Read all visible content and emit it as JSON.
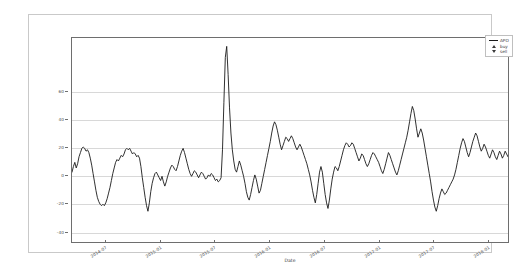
{
  "figure": {
    "background": "#ffffff",
    "border_color": "#c9c9c9",
    "axes_color": "#6e6e6e",
    "grid_color": "#d8d8d8",
    "line_color": "#1a1a1a"
  },
  "legend": {
    "position": "top-right",
    "entries": [
      {
        "label": "APO",
        "marker": "line",
        "icon": "line-marker-icon"
      },
      {
        "label": "buy",
        "marker": "triangle-up",
        "icon": "triangle-up-icon"
      },
      {
        "label": "sell",
        "marker": "triangle-down",
        "icon": "triangle-down-icon"
      }
    ]
  },
  "chart_data": {
    "type": "line",
    "title": "",
    "subtitle": "",
    "xlabel": "Date",
    "ylabel": "",
    "grid": true,
    "legend_position": "upper right",
    "ylim": [
      -48,
      98
    ],
    "yticks": [
      60,
      40,
      20,
      0,
      -20,
      -40
    ],
    "ytick_labels": [
      "60",
      "40",
      "20",
      "0",
      "-20",
      "-40"
    ],
    "xlim": [
      "2014-04",
      "2018-04"
    ],
    "xticks": [
      "2014-07",
      "2015-01",
      "2015-07",
      "2016-01",
      "2016-07",
      "2017-01",
      "2017-07",
      "2018-01"
    ],
    "xtick_labels": [
      "2014-07",
      "2015-01",
      "2015-07",
      "2016-01",
      "2016-07",
      "2017-01",
      "2017-07",
      "2018-01"
    ],
    "series": [
      {
        "name": "APO",
        "color": "#1a1a1a",
        "values": [
          2,
          6,
          9,
          5,
          8,
          13,
          16,
          19,
          20,
          19,
          17,
          18,
          16,
          12,
          7,
          1,
          -5,
          -11,
          -16,
          -19,
          -21,
          -22,
          -21,
          -22,
          -20,
          -17,
          -13,
          -9,
          -4,
          1,
          5,
          9,
          11,
          10,
          12,
          14,
          13,
          15,
          18,
          19,
          18,
          19,
          17,
          15,
          16,
          15,
          13,
          14,
          12,
          6,
          -2,
          -9,
          -16,
          -22,
          -26,
          -20,
          -12,
          -6,
          -2,
          1,
          2,
          0,
          -2,
          -4,
          -1,
          -5,
          -8,
          -5,
          -1,
          2,
          5,
          7,
          6,
          4,
          3,
          6,
          10,
          14,
          17,
          19,
          16,
          12,
          8,
          4,
          1,
          -1,
          1,
          3,
          2,
          0,
          -2,
          0,
          2,
          1,
          -1,
          -3,
          -2,
          0,
          -1,
          1,
          0,
          -2,
          -4,
          -3,
          -5,
          -4,
          -2,
          18,
          52,
          84,
          92,
          72,
          48,
          30,
          18,
          10,
          4,
          2,
          6,
          10,
          7,
          3,
          -1,
          -6,
          -12,
          -16,
          -18,
          -14,
          -9,
          -4,
          0,
          -3,
          -8,
          -13,
          -11,
          -6,
          -1,
          4,
          9,
          14,
          19,
          24,
          30,
          35,
          38,
          36,
          32,
          27,
          22,
          18,
          21,
          24,
          27,
          26,
          24,
          26,
          28,
          26,
          23,
          20,
          18,
          20,
          22,
          20,
          17,
          14,
          11,
          8,
          4,
          0,
          -5,
          -11,
          -16,
          -20,
          -14,
          -6,
          2,
          6,
          2,
          -6,
          -14,
          -20,
          -24,
          -18,
          -10,
          -3,
          2,
          6,
          5,
          3,
          6,
          10,
          14,
          18,
          21,
          23,
          22,
          20,
          21,
          23,
          22,
          19,
          16,
          13,
          10,
          12,
          15,
          14,
          11,
          8,
          6,
          8,
          11,
          14,
          16,
          15,
          13,
          11,
          9,
          6,
          3,
          1,
          4,
          8,
          12,
          16,
          14,
          11,
          8,
          5,
          2,
          0,
          3,
          7,
          11,
          15,
          19,
          23,
          27,
          32,
          38,
          44,
          49,
          46,
          40,
          33,
          27,
          30,
          33,
          30,
          25,
          19,
          13,
          7,
          1,
          -5,
          -12,
          -18,
          -23,
          -26,
          -22,
          -17,
          -13,
          -10,
          -12,
          -14,
          -13,
          -11,
          -9,
          -7,
          -5,
          -3,
          0,
          4,
          9,
          14,
          19,
          23,
          26,
          24,
          20,
          16,
          13,
          16,
          20,
          24,
          27,
          30,
          28,
          24,
          20,
          17,
          19,
          22,
          20,
          17,
          14,
          12,
          15,
          18,
          16,
          13,
          11,
          14,
          17,
          15,
          12,
          14,
          17,
          15,
          13
        ]
      },
      {
        "name": "buy",
        "color": "#3a3a3a",
        "marker": "triangle-up",
        "points": []
      },
      {
        "name": "sell",
        "color": "#3a3a3a",
        "marker": "triangle-down",
        "points": []
      }
    ]
  }
}
